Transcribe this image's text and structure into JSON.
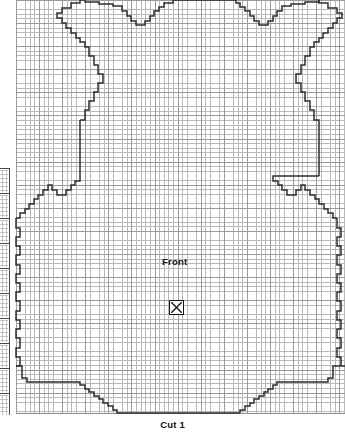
{
  "document": {
    "type": "sewing-pattern-chart",
    "title": "Front bodice pattern piece",
    "background_color": "#ffffff"
  },
  "grid": {
    "minor_color": "#b9b9b9",
    "major_color": "#9b9b9b",
    "minor_cell_px": 4.62,
    "major_every": 5,
    "left_px": 16,
    "top_px": 0,
    "width_px": 329,
    "height_px": 414
  },
  "outline": {
    "stroke_color": "#2e2e2e",
    "stroke_width": 1.5,
    "description": "stepped garment front outline: shoulders, V-neckline, armholes, waist notches, flared hem"
  },
  "labels": {
    "piece_name": "Front",
    "cut_instruction": "Cut 1"
  },
  "markers": {
    "grainline_symbol": "x-in-box",
    "grainline_glyph": "⌧"
  },
  "side_strip": {
    "present": true,
    "cell_count": 10,
    "border_color": "#4a4a4a",
    "note": "clipped edge of an adjacent chart column"
  }
}
